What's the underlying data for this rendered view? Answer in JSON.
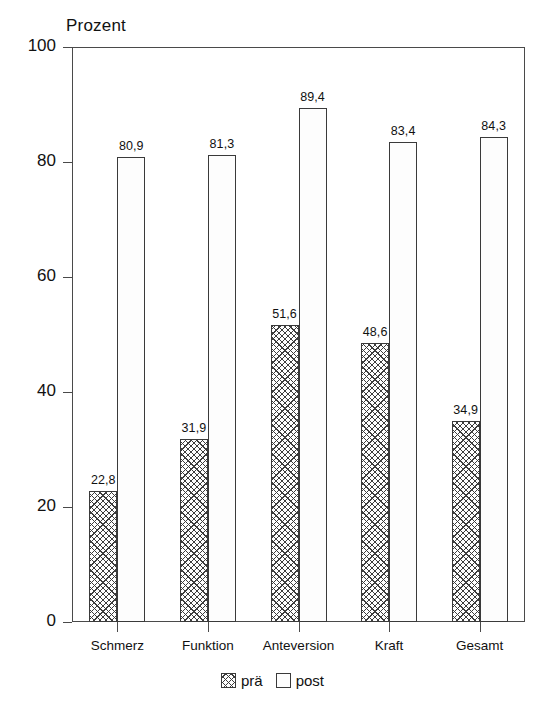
{
  "chart_data": {
    "type": "bar",
    "title": "",
    "ylabel": "Prozent",
    "xlabel": "",
    "categories": [
      "Schmerz",
      "Funktion",
      "Anteversion",
      "Kraft",
      "Gesamt"
    ],
    "series": [
      {
        "name": "prä",
        "values": [
          22.8,
          31.9,
          51.6,
          48.6,
          34.9
        ],
        "value_labels": [
          "22,8",
          "31,9",
          "51,6",
          "48,6",
          "34,9"
        ],
        "pattern": "cross-hatch"
      },
      {
        "name": "post",
        "values": [
          80.9,
          81.3,
          89.4,
          83.4,
          84.3
        ],
        "value_labels": [
          "80,9",
          "81,3",
          "89,4",
          "83,4",
          "84,3"
        ],
        "pattern": "fine-dots"
      }
    ],
    "ylim": [
      0,
      100
    ],
    "yticks": [
      0,
      20,
      40,
      60,
      80,
      100
    ],
    "ytick_labels": [
      "0",
      "20",
      "40",
      "60",
      "80",
      "100"
    ],
    "grid": false,
    "legend_position": "bottom-center",
    "legend_entries": [
      "prä",
      "post"
    ],
    "colors": {
      "axis": "#4a4a4a",
      "bar_outline": "#3a3a3a",
      "pattern_ink": "#3d3d3d",
      "text": "#111111",
      "background": "#ffffff"
    }
  }
}
